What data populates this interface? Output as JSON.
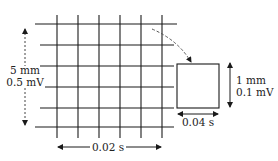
{
  "diagram": {
    "type": "ecg-grid-scale",
    "colors": {
      "line": "#1a1a1a",
      "dashed": "#555555",
      "text": "#222222",
      "background": "#ffffff"
    },
    "grid": {
      "vertical_lines_x": [
        57,
        78,
        99,
        120,
        141,
        162
      ],
      "horizontal_lines": [
        {
          "y": 24,
          "x1": 35,
          "x2": 177
        },
        {
          "y": 45,
          "x1": 40,
          "x2": 174
        },
        {
          "y": 66,
          "x1": 40,
          "x2": 174
        },
        {
          "y": 87,
          "x1": 45,
          "x2": 174
        },
        {
          "y": 108,
          "x1": 40,
          "x2": 174
        },
        {
          "y": 127,
          "x1": 35,
          "x2": 174
        }
      ],
      "vertical_y_range": [
        15,
        138
      ]
    },
    "large_box_labels": {
      "vertical_line1": "5 mm",
      "vertical_line2": "0.5 mV",
      "horizontal": "0.02 s"
    },
    "small_box_labels": {
      "vertical_line1": "1 mm",
      "vertical_line2": "0.1 mV",
      "horizontal": "0.04 s"
    }
  }
}
